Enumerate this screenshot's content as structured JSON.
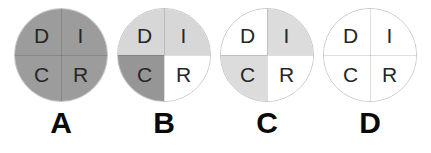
{
  "figure": {
    "discs": [
      {
        "label": "A",
        "segments": [
          {
            "letter": "D",
            "fill": "#9c9c9c"
          },
          {
            "letter": "I",
            "fill": "#9c9c9c"
          },
          {
            "letter": "C",
            "fill": "#9c9c9c"
          },
          {
            "letter": "R",
            "fill": "#9c9c9c"
          }
        ]
      },
      {
        "label": "B",
        "segments": [
          {
            "letter": "D",
            "fill": "#d7d7d7"
          },
          {
            "letter": "I",
            "fill": "#d7d7d7"
          },
          {
            "letter": "C",
            "fill": "#969696"
          },
          {
            "letter": "R",
            "fill": "#ffffff"
          }
        ]
      },
      {
        "label": "C",
        "segments": [
          {
            "letter": "D",
            "fill": "#ffffff"
          },
          {
            "letter": "I",
            "fill": "#dcdcdc"
          },
          {
            "letter": "C",
            "fill": "#dcdcdc"
          },
          {
            "letter": "R",
            "fill": "#ffffff"
          }
        ]
      },
      {
        "label": "D",
        "segments": [
          {
            "letter": "D",
            "fill": "#ffffff"
          },
          {
            "letter": "I",
            "fill": "#ffffff"
          },
          {
            "letter": "C",
            "fill": "#ffffff"
          },
          {
            "letter": "R",
            "fill": "#ffffff"
          }
        ]
      }
    ]
  }
}
